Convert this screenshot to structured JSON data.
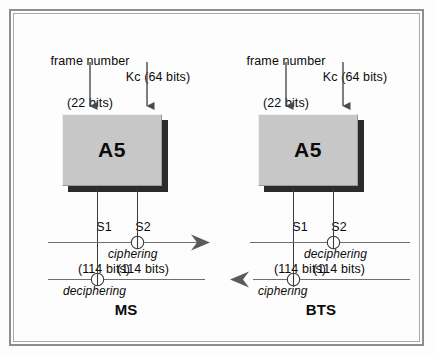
{
  "figure": {
    "background_color": "#fdfdfd",
    "frame_color": "#8d8d8d",
    "block_fill_color": "#c7c7c7",
    "line_color": "#6e6e6e"
  },
  "sides": [
    {
      "id": "ms",
      "name_label": "MS",
      "inputs": [
        {
          "label_line1": "frame number",
          "label_line2": "(22 bits)"
        },
        {
          "label_line1": "Kc (64 bits)",
          "label_line2": ""
        }
      ],
      "block_label": "A5",
      "outputs": [
        {
          "name": "S1",
          "bits": "(114 bits)"
        },
        {
          "name": "S2",
          "bits": "(114 bits)"
        }
      ],
      "upper_operation": "ciphering",
      "lower_operation": "deciphering",
      "upper_arrow_direction": "right",
      "lower_arrow_direction": "none"
    },
    {
      "id": "bts",
      "name_label": "BTS",
      "inputs": [
        {
          "label_line1": "frame number",
          "label_line2": "(22 bits)"
        },
        {
          "label_line1": "Kc (64 bits)",
          "label_line2": ""
        }
      ],
      "block_label": "A5",
      "outputs": [
        {
          "name": "S1",
          "bits": "(114 bits)"
        },
        {
          "name": "S2",
          "bits": "(114 bits)"
        }
      ],
      "upper_operation": "deciphering",
      "lower_operation": "ciphering",
      "upper_arrow_direction": "none",
      "lower_arrow_direction": "left"
    }
  ]
}
